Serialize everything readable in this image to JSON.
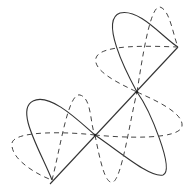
{
  "diagram": {
    "colors": {
      "background": "#ffffff",
      "stroke": "#333333"
    },
    "axis": {
      "start": [
        52,
        182
      ],
      "end": [
        178,
        47
      ]
    },
    "nodes": [
      [
        95,
        135
      ],
      [
        137,
        92
      ]
    ],
    "legend": []
  }
}
